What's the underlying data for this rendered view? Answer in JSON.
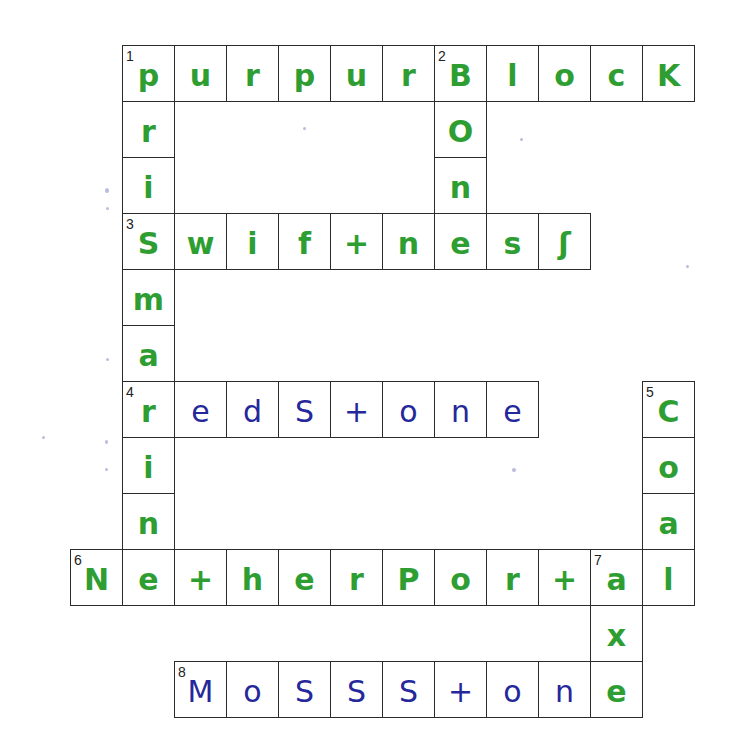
{
  "puzzle": {
    "grid": {
      "origin_x": 70,
      "origin_y": 45,
      "cell_w": 52,
      "cell_h": 56
    },
    "colors": {
      "green_ink": "#2f9e32",
      "blue_ink": "#25289a",
      "grid_line": "#2b2b2b"
    },
    "entries": [
      {
        "number": 1,
        "direction": "across",
        "row": 0,
        "col": 1,
        "answer": "purpurBlocK",
        "ink": "ggggggggggg"
      },
      {
        "number": 1,
        "direction": "down",
        "row": 0,
        "col": 1,
        "answer": "priSmarine",
        "ink": "gggggggggg"
      },
      {
        "number": 2,
        "direction": "down",
        "row": 0,
        "col": 7,
        "answer": "Bone",
        "ink": "gggg"
      },
      {
        "number": 3,
        "direction": "across",
        "row": 3,
        "col": 1,
        "answer": "Swif+nessS",
        "ink": "ggggggggg"
      },
      {
        "number": 4,
        "direction": "across",
        "row": 6,
        "col": 1,
        "answer": "redStone",
        "ink": "gbbbbbbb"
      },
      {
        "number": 5,
        "direction": "down",
        "row": 6,
        "col": 11,
        "answer": "Coal",
        "ink": "gggg"
      },
      {
        "number": 6,
        "direction": "across",
        "row": 9,
        "col": 0,
        "answer": "Ne+herPor+al",
        "ink": "gggggggggggg"
      },
      {
        "number": 7,
        "direction": "down",
        "row": 9,
        "col": 10,
        "answer": "axe",
        "ink": "ggg"
      },
      {
        "number": 8,
        "direction": "across",
        "row": 11,
        "col": 2,
        "answer": "MossS+one",
        "ink": "bbbbbbbbg"
      }
    ],
    "cells": [
      {
        "r": 0,
        "c": 1,
        "ch": "p",
        "ink": "g",
        "num": "1"
      },
      {
        "r": 0,
        "c": 2,
        "ch": "u",
        "ink": "g"
      },
      {
        "r": 0,
        "c": 3,
        "ch": "r",
        "ink": "g"
      },
      {
        "r": 0,
        "c": 4,
        "ch": "p",
        "ink": "g"
      },
      {
        "r": 0,
        "c": 5,
        "ch": "u",
        "ink": "g"
      },
      {
        "r": 0,
        "c": 6,
        "ch": "r",
        "ink": "g"
      },
      {
        "r": 0,
        "c": 7,
        "ch": "B",
        "ink": "g",
        "num": "2"
      },
      {
        "r": 0,
        "c": 8,
        "ch": "l",
        "ink": "g"
      },
      {
        "r": 0,
        "c": 9,
        "ch": "o",
        "ink": "g"
      },
      {
        "r": 0,
        "c": 10,
        "ch": "c",
        "ink": "g"
      },
      {
        "r": 0,
        "c": 11,
        "ch": "K",
        "ink": "g"
      },
      {
        "r": 1,
        "c": 1,
        "ch": "r",
        "ink": "g"
      },
      {
        "r": 1,
        "c": 7,
        "ch": "O",
        "ink": "g"
      },
      {
        "r": 2,
        "c": 1,
        "ch": "i",
        "ink": "g"
      },
      {
        "r": 2,
        "c": 7,
        "ch": "n",
        "ink": "g"
      },
      {
        "r": 3,
        "c": 1,
        "ch": "S",
        "ink": "g",
        "num": "3"
      },
      {
        "r": 3,
        "c": 2,
        "ch": "w",
        "ink": "g"
      },
      {
        "r": 3,
        "c": 3,
        "ch": "i",
        "ink": "g"
      },
      {
        "r": 3,
        "c": 4,
        "ch": "f",
        "ink": "g"
      },
      {
        "r": 3,
        "c": 5,
        "ch": "+",
        "ink": "g"
      },
      {
        "r": 3,
        "c": 6,
        "ch": "n",
        "ink": "g"
      },
      {
        "r": 3,
        "c": 7,
        "ch": "e",
        "ink": "g"
      },
      {
        "r": 3,
        "c": 8,
        "ch": "s",
        "ink": "g"
      },
      {
        "r": 3,
        "c": 9,
        "ch": "ʃ",
        "ink": "g"
      },
      {
        "r": 4,
        "c": 1,
        "ch": "m",
        "ink": "g"
      },
      {
        "r": 5,
        "c": 1,
        "ch": "a",
        "ink": "g"
      },
      {
        "r": 6,
        "c": 1,
        "ch": "r",
        "ink": "g",
        "num": "4"
      },
      {
        "r": 6,
        "c": 2,
        "ch": "e",
        "ink": "b"
      },
      {
        "r": 6,
        "c": 3,
        "ch": "d",
        "ink": "b"
      },
      {
        "r": 6,
        "c": 4,
        "ch": "S",
        "ink": "b"
      },
      {
        "r": 6,
        "c": 5,
        "ch": "+",
        "ink": "b"
      },
      {
        "r": 6,
        "c": 6,
        "ch": "o",
        "ink": "b"
      },
      {
        "r": 6,
        "c": 7,
        "ch": "n",
        "ink": "b"
      },
      {
        "r": 6,
        "c": 8,
        "ch": "e",
        "ink": "b"
      },
      {
        "r": 6,
        "c": 11,
        "ch": "C",
        "ink": "g",
        "num": "5"
      },
      {
        "r": 7,
        "c": 1,
        "ch": "i",
        "ink": "g"
      },
      {
        "r": 7,
        "c": 11,
        "ch": "o",
        "ink": "g"
      },
      {
        "r": 8,
        "c": 1,
        "ch": "n",
        "ink": "g"
      },
      {
        "r": 8,
        "c": 11,
        "ch": "a",
        "ink": "g"
      },
      {
        "r": 9,
        "c": 0,
        "ch": "N",
        "ink": "g",
        "num": "6"
      },
      {
        "r": 9,
        "c": 1,
        "ch": "e",
        "ink": "g"
      },
      {
        "r": 9,
        "c": 2,
        "ch": "+",
        "ink": "g"
      },
      {
        "r": 9,
        "c": 3,
        "ch": "h",
        "ink": "g"
      },
      {
        "r": 9,
        "c": 4,
        "ch": "e",
        "ink": "g"
      },
      {
        "r": 9,
        "c": 5,
        "ch": "r",
        "ink": "g"
      },
      {
        "r": 9,
        "c": 6,
        "ch": "P",
        "ink": "g"
      },
      {
        "r": 9,
        "c": 7,
        "ch": "o",
        "ink": "g"
      },
      {
        "r": 9,
        "c": 8,
        "ch": "r",
        "ink": "g"
      },
      {
        "r": 9,
        "c": 9,
        "ch": "+",
        "ink": "g"
      },
      {
        "r": 9,
        "c": 10,
        "ch": "a",
        "ink": "g",
        "num": "7"
      },
      {
        "r": 9,
        "c": 11,
        "ch": "l",
        "ink": "g"
      },
      {
        "r": 10,
        "c": 10,
        "ch": "x",
        "ink": "g"
      },
      {
        "r": 11,
        "c": 2,
        "ch": "M",
        "ink": "b",
        "num": "8"
      },
      {
        "r": 11,
        "c": 3,
        "ch": "o",
        "ink": "b"
      },
      {
        "r": 11,
        "c": 4,
        "ch": "S",
        "ink": "b"
      },
      {
        "r": 11,
        "c": 5,
        "ch": "S",
        "ink": "b"
      },
      {
        "r": 11,
        "c": 6,
        "ch": "S",
        "ink": "b"
      },
      {
        "r": 11,
        "c": 7,
        "ch": "+",
        "ink": "b"
      },
      {
        "r": 11,
        "c": 8,
        "ch": "o",
        "ink": "b"
      },
      {
        "r": 11,
        "c": 9,
        "ch": "n",
        "ink": "b"
      },
      {
        "r": 11,
        "c": 10,
        "ch": "e",
        "ink": "g"
      }
    ]
  }
}
